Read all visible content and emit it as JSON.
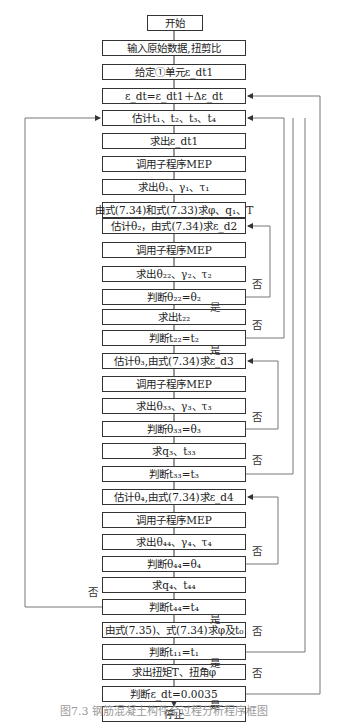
{
  "flowchart": {
    "nodes": [
      {
        "id": "start",
        "text": "开始",
        "x": 147,
        "y": 15,
        "w": 56,
        "h": 16
      },
      {
        "id": "input",
        "text": "输入原始数据,扭剪比",
        "x": 102,
        "y": 40,
        "w": 144,
        "h": 16
      },
      {
        "id": "given",
        "text": "给定①单元ε_dt1",
        "x": 102,
        "y": 64,
        "w": 144,
        "h": 16
      },
      {
        "id": "eps-update",
        "text": "ε_dt=ε_dt1＋Δε_dt",
        "x": 102,
        "y": 88,
        "w": 144,
        "h": 16
      },
      {
        "id": "est-t",
        "text": "估计t₁、t₂、t₃、t₄",
        "x": 102,
        "y": 110,
        "w": 144,
        "h": 16
      },
      {
        "id": "calc-eps",
        "text": "求出ε_dt1",
        "x": 102,
        "y": 133,
        "w": 144,
        "h": 16
      },
      {
        "id": "mep1",
        "text": "调用子程序MEP",
        "x": 102,
        "y": 156,
        "w": 144,
        "h": 16
      },
      {
        "id": "calc-theta1",
        "text": "求出θ₁、γ₁、τ₁",
        "x": 102,
        "y": 179,
        "w": 144,
        "h": 16
      },
      {
        "id": "calc-phi",
        "text": "由式(7.34)和式(7.33)求φ、q₁、T",
        "x": 102,
        "y": 202,
        "w": 144,
        "h": 16
      },
      {
        "id": "est-theta2",
        "text": "估计θ₂，由式(7.34)求ε_d2",
        "x": 102,
        "y": 218,
        "w": 144,
        "h": 16
      },
      {
        "id": "mep2",
        "text": "调用子程序MEP",
        "x": 102,
        "y": 242,
        "w": 144,
        "h": 16
      },
      {
        "id": "calc-theta22",
        "text": "求出θ₂₂、γ₂、τ₂",
        "x": 102,
        "y": 266,
        "w": 144,
        "h": 16
      },
      {
        "id": "judge-theta2",
        "text": "判断θ₂₂=θ₂",
        "x": 102,
        "y": 289,
        "w": 144,
        "h": 16
      },
      {
        "id": "calc-t22",
        "text": "求出t₂₂",
        "x": 102,
        "y": 309,
        "w": 144,
        "h": 16
      },
      {
        "id": "judge-t2",
        "text": "判断t₂₂=t₂",
        "x": 102,
        "y": 330,
        "w": 144,
        "h": 16
      },
      {
        "id": "est-theta3",
        "text": "估计θ₃,由式(7.34)求ε_d3",
        "x": 102,
        "y": 353,
        "w": 144,
        "h": 16
      },
      {
        "id": "mep3",
        "text": "调用子程序MEP",
        "x": 102,
        "y": 376,
        "w": 144,
        "h": 16
      },
      {
        "id": "calc-theta33",
        "text": "求出θ₃₃、γ₃、τ₃",
        "x": 102,
        "y": 398,
        "w": 144,
        "h": 16
      },
      {
        "id": "judge-theta3",
        "text": "判断θ₃₃=θ₃",
        "x": 102,
        "y": 421,
        "w": 144,
        "h": 16
      },
      {
        "id": "calc-q3",
        "text": "求q₃、t₃₃",
        "x": 102,
        "y": 443,
        "w": 144,
        "h": 16
      },
      {
        "id": "judge-t3",
        "text": "判断t₃₃=t₃",
        "x": 102,
        "y": 466,
        "w": 144,
        "h": 16
      },
      {
        "id": "est-theta4",
        "text": "估计θ₄,由式(7.34)求ε_d4",
        "x": 102,
        "y": 489,
        "w": 144,
        "h": 16
      },
      {
        "id": "mep4",
        "text": "调用子程序MEP",
        "x": 102,
        "y": 512,
        "w": 144,
        "h": 16
      },
      {
        "id": "calc-theta44",
        "text": "求出θ₄₄、γ₄、τ₄",
        "x": 102,
        "y": 534,
        "w": 144,
        "h": 16
      },
      {
        "id": "judge-theta4",
        "text": "判断θ₄₄=θ₄",
        "x": 102,
        "y": 556,
        "w": 144,
        "h": 16
      },
      {
        "id": "calc-q4",
        "text": "求q₄、t₄₄",
        "x": 102,
        "y": 577,
        "w": 144,
        "h": 16
      },
      {
        "id": "judge-t4",
        "text": "判断t₄₄=t₄",
        "x": 102,
        "y": 599,
        "w": 144,
        "h": 16
      },
      {
        "id": "calc-t0",
        "text": "由式(7.35)、式(7.34)求φ及t₀",
        "x": 102,
        "y": 622,
        "w": 144,
        "h": 16
      },
      {
        "id": "judge-t1",
        "text": "判断t₁₁=t₁",
        "x": 102,
        "y": 644,
        "w": 144,
        "h": 16
      },
      {
        "id": "calc-torque",
        "text": "求出扭矩T、扭角φ",
        "x": 102,
        "y": 664,
        "w": 144,
        "h": 16
      },
      {
        "id": "judge-eps",
        "text": "判断ε_dt=0.0035",
        "x": 102,
        "y": 686,
        "w": 144,
        "h": 16
      },
      {
        "id": "stop",
        "text": "停止",
        "x": 102,
        "y": 706,
        "w": 144,
        "h": 16
      }
    ],
    "labels": {
      "yes": "是",
      "no": "否"
    },
    "yes_labels": [
      {
        "x": 210,
        "y": 302
      },
      {
        "x": 210,
        "y": 345
      },
      {
        "x": 210,
        "y": 614
      },
      {
        "x": 210,
        "y": 658
      },
      {
        "x": 210,
        "y": 700
      }
    ],
    "no_labels": [
      {
        "x": 252,
        "y": 279
      },
      {
        "x": 252,
        "y": 320
      },
      {
        "x": 252,
        "y": 412
      },
      {
        "x": 252,
        "y": 455
      },
      {
        "x": 252,
        "y": 546
      },
      {
        "x": 88,
        "y": 587
      },
      {
        "x": 252,
        "y": 626
      },
      {
        "x": 252,
        "y": 668
      }
    ],
    "caption": "图7.3  钢筋混凝土构件全过程分析程序框图"
  }
}
